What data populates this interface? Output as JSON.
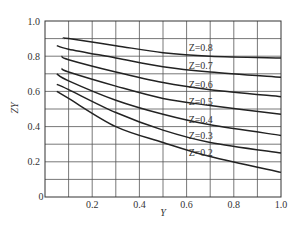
{
  "chart_data": {
    "type": "line",
    "title": "",
    "xlabel": "Y",
    "ylabel": "ZY",
    "xlim": [
      0,
      1.0
    ],
    "ylim": [
      0,
      1.0
    ],
    "grid": true,
    "x_ticks": [
      "0.2",
      "0.4",
      "0.6",
      "0.8",
      "1.0"
    ],
    "y_ticks": [
      "0.2",
      "0.4",
      "0.6",
      "0.8",
      "1.0"
    ],
    "origin_label": "0",
    "legend_position": "inline-labels",
    "series": [
      {
        "name": "Z=0.8",
        "label": "Z=0.8",
        "points": [
          [
            0.08,
            0.9
          ],
          [
            0.1,
            0.9
          ],
          [
            0.3,
            0.86
          ],
          [
            0.5,
            0.82
          ],
          [
            0.7,
            0.8
          ],
          [
            1.0,
            0.79
          ]
        ]
      },
      {
        "name": "Z=0.7",
        "label": "Z=0.7",
        "points": [
          [
            0.05,
            0.86
          ],
          [
            0.1,
            0.84
          ],
          [
            0.3,
            0.79
          ],
          [
            0.5,
            0.74
          ],
          [
            0.7,
            0.71
          ],
          [
            1.0,
            0.68
          ]
        ]
      },
      {
        "name": "Z=0.6",
        "label": "Z=0.6",
        "points": [
          [
            0.07,
            0.8
          ],
          [
            0.1,
            0.78
          ],
          [
            0.3,
            0.71
          ],
          [
            0.5,
            0.65
          ],
          [
            0.7,
            0.61
          ],
          [
            1.0,
            0.57
          ]
        ]
      },
      {
        "name": "Z=0.5",
        "label": "Z=0.5",
        "points": [
          [
            0.07,
            0.73
          ],
          [
            0.1,
            0.71
          ],
          [
            0.3,
            0.63
          ],
          [
            0.5,
            0.56
          ],
          [
            0.7,
            0.52
          ],
          [
            1.0,
            0.47
          ]
        ]
      },
      {
        "name": "Z=0.4",
        "label": "Z=0.4",
        "points": [
          [
            0.05,
            0.7
          ],
          [
            0.1,
            0.66
          ],
          [
            0.3,
            0.55
          ],
          [
            0.5,
            0.47
          ],
          [
            0.7,
            0.41
          ],
          [
            1.0,
            0.35
          ]
        ]
      },
      {
        "name": "Z=0.3",
        "label": "Z=0.3",
        "points": [
          [
            0.05,
            0.64
          ],
          [
            0.1,
            0.61
          ],
          [
            0.3,
            0.48
          ],
          [
            0.5,
            0.38
          ],
          [
            0.7,
            0.31
          ],
          [
            1.0,
            0.25
          ]
        ]
      },
      {
        "name": "Z=0.2",
        "label": "Z=0.2",
        "points": [
          [
            0.05,
            0.6
          ],
          [
            0.1,
            0.56
          ],
          [
            0.3,
            0.4
          ],
          [
            0.5,
            0.31
          ],
          [
            0.7,
            0.23
          ],
          [
            1.0,
            0.14
          ]
        ]
      }
    ],
    "label_positions": [
      {
        "x": 0.66,
        "y": 0.85
      },
      {
        "x": 0.66,
        "y": 0.745
      },
      {
        "x": 0.66,
        "y": 0.64
      },
      {
        "x": 0.66,
        "y": 0.545
      },
      {
        "x": 0.66,
        "y": 0.443
      },
      {
        "x": 0.66,
        "y": 0.352
      },
      {
        "x": 0.66,
        "y": 0.255
      }
    ],
    "colors": {
      "line": "#222222",
      "grid": "#555555",
      "text": "#333333"
    }
  }
}
